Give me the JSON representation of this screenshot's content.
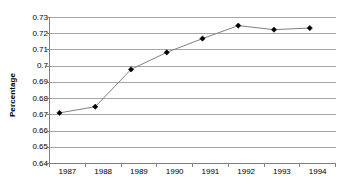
{
  "chart_data": {
    "type": "line",
    "title": "",
    "xlabel": "",
    "ylabel": "Percentage",
    "categories": [
      "1987",
      "1988",
      "1989",
      "1990",
      "1991",
      "1992",
      "1993",
      "1994"
    ],
    "values": [
      0.6712,
      0.675,
      0.698,
      0.7085,
      0.717,
      0.725,
      0.7225,
      0.7235
    ],
    "series": [
      {
        "name": "Percentage",
        "values": [
          0.6712,
          0.675,
          0.698,
          0.7085,
          0.717,
          0.725,
          0.7225,
          0.7235
        ]
      }
    ],
    "ylim": [
      0.64,
      0.73
    ],
    "ytick_step": 0.01,
    "ytick_labels": [
      "0.73",
      "0.72",
      "0.71",
      "0.7",
      "0.69",
      "0.68",
      "0.67",
      "0.66",
      "0.65",
      "0.64"
    ],
    "ytick_values": [
      0.73,
      0.72,
      0.71,
      0.7,
      0.69,
      0.68,
      0.67,
      0.66,
      0.65,
      0.64
    ],
    "xtick_labels": [
      "1987",
      "1988",
      "1989",
      "1990",
      "1991",
      "1992",
      "1993",
      "1994"
    ],
    "grid": "horizontal",
    "legend": "none",
    "marker": "diamond",
    "colors": {
      "line": "#808080",
      "marker": "#000000",
      "grid": "#a6a6a6",
      "axis": "#808080",
      "background": "#ffffff",
      "text": "#000000"
    }
  }
}
